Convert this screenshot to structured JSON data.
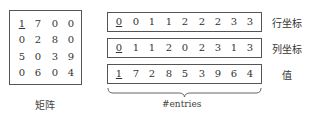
{
  "matrix": {
    "rows": [
      [
        "1",
        "7",
        "0",
        "0"
      ],
      [
        "0",
        "2",
        "8",
        "0"
      ],
      [
        "5",
        "0",
        "3",
        "9"
      ],
      [
        "0",
        "6",
        "0",
        "4"
      ]
    ],
    "caption": "矩阵"
  },
  "arrays": [
    {
      "values": [
        "0",
        "0",
        "1",
        "1",
        "2",
        "2",
        "2",
        "3",
        "3"
      ],
      "label": "行坐标"
    },
    {
      "values": [
        "0",
        "1",
        "1",
        "2",
        "0",
        "2",
        "3",
        "1",
        "3"
      ],
      "label": "列坐标"
    },
    {
      "values": [
        "1",
        "7",
        "2",
        "8",
        "5",
        "3",
        "9",
        "6",
        "4"
      ],
      "label": "值"
    }
  ],
  "brace_label": "#entries"
}
